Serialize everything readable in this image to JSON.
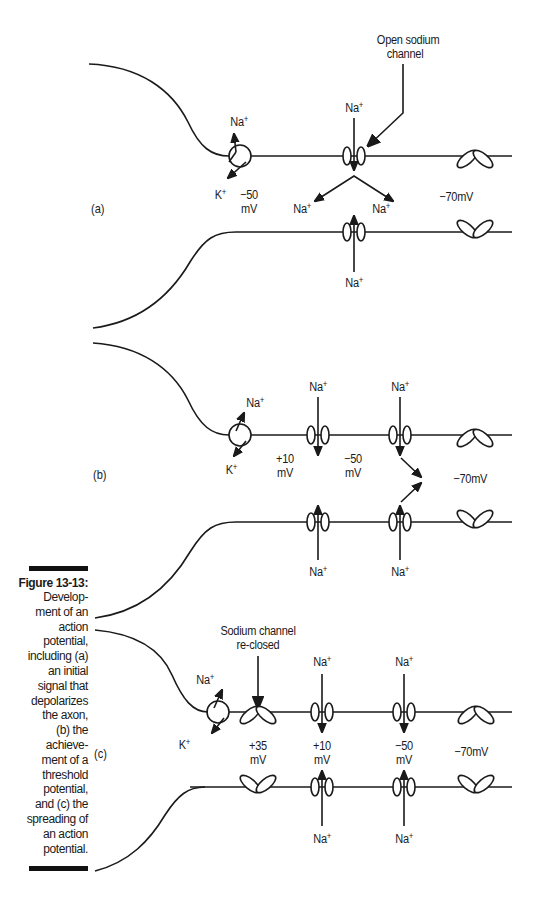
{
  "figure": {
    "caption": {
      "title": "Figure 13-13:",
      "text": "Develop-\nment of an\naction\npotential,\nincluding (a)\nan initial\nsignal that\ndepolarizes\nthe axon,\n(b) the\nachieve-\nment of a\nthreshold\npotential,\nand (c) the\nspreading of\nan action\npotential."
    },
    "panels": [
      {
        "tag": "(a)",
        "callout": [
          "Open sodium",
          "channel"
        ],
        "soma_ions": {
          "in": "Na+",
          "out": "K+"
        },
        "voltages": [
          {
            "value": "−50",
            "unit": "mV"
          }
        ],
        "resting": "−70mV",
        "ions": {
          "top_in": "Na+",
          "spread_left": "Na+",
          "spread_right": "Na+",
          "bottom_in": "Na+"
        }
      },
      {
        "tag": "(b)",
        "soma_ions": {
          "in": "Na+",
          "out": "K+"
        },
        "voltages": [
          {
            "value": "+10",
            "unit": "mV"
          },
          {
            "value": "−50",
            "unit": "mV"
          }
        ],
        "resting": "−70mV",
        "ions": {
          "top_1": "Na+",
          "top_2": "Na+",
          "bottom_1": "Na+",
          "bottom_2": "Na+"
        }
      },
      {
        "tag": "(c)",
        "callout": [
          "Sodium channel",
          "re-closed"
        ],
        "soma_ions": {
          "in": "Na+",
          "out": "K+"
        },
        "voltages": [
          {
            "value": "+35",
            "unit": "mV"
          },
          {
            "value": "+10",
            "unit": "mV"
          },
          {
            "value": "−50",
            "unit": "mV"
          }
        ],
        "resting": "−70mV",
        "ions": {
          "top_1": "Na+",
          "top_2": "Na+",
          "bottom_1": "Na+",
          "bottom_2": "Na+"
        }
      }
    ],
    "colors": {
      "ink": "#1a1a1a",
      "background": "#ffffff"
    }
  }
}
